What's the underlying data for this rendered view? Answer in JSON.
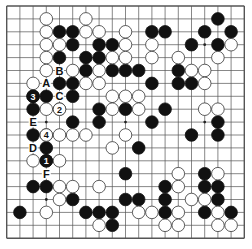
{
  "board": {
    "size": 19,
    "colors": {
      "background": "#ffffff",
      "line": "#555555",
      "black": "#111111",
      "white": "#ffffff",
      "white_stroke": "#333333"
    },
    "star_points": [
      [
        3,
        3
      ],
      [
        3,
        9
      ],
      [
        3,
        15
      ],
      [
        9,
        3
      ],
      [
        9,
        9
      ],
      [
        9,
        15
      ],
      [
        15,
        3
      ],
      [
        15,
        9
      ],
      [
        15,
        15
      ]
    ],
    "stones": {
      "black": [
        [
          1,
          16
        ],
        [
          2,
          4
        ],
        [
          2,
          5
        ],
        [
          2,
          11
        ],
        [
          2,
          12
        ],
        [
          2,
          15
        ],
        [
          2,
          17
        ],
        [
          3,
          5
        ],
        [
          3,
          7
        ],
        [
          3,
          8
        ],
        [
          3,
          14
        ],
        [
          3,
          16
        ],
        [
          4,
          4
        ],
        [
          4,
          6
        ],
        [
          4,
          7
        ],
        [
          5,
          6
        ],
        [
          5,
          8
        ],
        [
          5,
          9
        ],
        [
          5,
          10
        ],
        [
          5,
          13
        ],
        [
          6,
          4
        ],
        [
          6,
          5
        ],
        [
          6,
          11
        ],
        [
          6,
          13
        ],
        [
          6,
          14
        ],
        [
          7,
          2
        ],
        [
          7,
          3
        ],
        [
          7,
          5
        ],
        [
          8,
          2
        ],
        [
          8,
          7
        ],
        [
          8,
          9
        ],
        [
          8,
          12
        ],
        [
          9,
          5
        ],
        [
          9,
          7
        ],
        [
          9,
          11
        ],
        [
          9,
          16
        ],
        [
          10,
          2
        ],
        [
          10,
          14
        ],
        [
          10,
          16
        ],
        [
          11,
          3
        ],
        [
          11,
          10
        ],
        [
          12,
          3
        ],
        [
          13,
          9
        ],
        [
          13,
          15
        ],
        [
          14,
          2
        ],
        [
          14,
          3
        ],
        [
          14,
          12
        ],
        [
          14,
          15
        ],
        [
          14,
          16
        ],
        [
          15,
          5
        ],
        [
          15,
          9
        ],
        [
          15,
          10
        ],
        [
          15,
          12
        ],
        [
          15,
          16
        ],
        [
          16,
          1
        ],
        [
          16,
          6
        ],
        [
          16,
          7
        ],
        [
          16,
          8
        ],
        [
          16,
          12
        ],
        [
          16,
          15
        ],
        [
          16,
          17
        ],
        [
          17,
          8
        ]
      ],
      "white": [
        [
          1,
          3
        ],
        [
          1,
          6
        ],
        [
          2,
          3
        ],
        [
          2,
          6
        ],
        [
          2,
          7
        ],
        [
          2,
          9
        ],
        [
          3,
          3
        ],
        [
          3,
          4
        ],
        [
          3,
          9
        ],
        [
          3,
          11
        ],
        [
          3,
          17
        ],
        [
          4,
          3
        ],
        [
          4,
          8
        ],
        [
          4,
          9
        ],
        [
          4,
          11
        ],
        [
          4,
          13
        ],
        [
          4,
          16
        ],
        [
          5,
          3
        ],
        [
          5,
          5
        ],
        [
          5,
          7
        ],
        [
          5,
          14
        ],
        [
          5,
          15
        ],
        [
          6,
          2
        ],
        [
          6,
          6
        ],
        [
          6,
          7
        ],
        [
          6,
          15
        ],
        [
          7,
          8
        ],
        [
          7,
          9
        ],
        [
          7,
          10
        ],
        [
          8,
          3
        ],
        [
          8,
          4
        ],
        [
          8,
          8
        ],
        [
          8,
          10
        ],
        [
          8,
          15
        ],
        [
          8,
          16
        ],
        [
          10,
          3
        ],
        [
          10,
          4
        ],
        [
          10,
          5
        ],
        [
          10,
          6
        ],
        [
          10,
          9
        ],
        [
          11,
          8
        ],
        [
          12,
          2
        ],
        [
          12,
          4
        ],
        [
          13,
          13
        ],
        [
          13,
          16
        ],
        [
          14,
          4
        ],
        [
          14,
          5
        ],
        [
          14,
          7
        ],
        [
          14,
          13
        ],
        [
          15,
          4
        ],
        [
          15,
          14
        ],
        [
          15,
          15
        ],
        [
          16,
          3
        ],
        [
          16,
          10
        ],
        [
          16,
          11
        ],
        [
          16,
          13
        ],
        [
          16,
          16
        ],
        [
          17,
          7
        ],
        [
          17,
          12
        ],
        [
          17,
          13
        ],
        [
          17,
          16
        ],
        [
          17,
          17
        ]
      ]
    },
    "numbered_moves": [
      {
        "number": "1",
        "color": "black",
        "row": 12,
        "col": 3
      },
      {
        "number": "2",
        "color": "white",
        "row": 8,
        "col": 4
      },
      {
        "number": "3",
        "color": "black",
        "row": 7,
        "col": 2
      },
      {
        "number": "4",
        "color": "white",
        "row": 10,
        "col": 3
      }
    ],
    "letter_labels": [
      {
        "label": "A",
        "row": 6,
        "col": 3
      },
      {
        "label": "B",
        "row": 5,
        "col": 4
      },
      {
        "label": "C",
        "row": 7,
        "col": 4
      },
      {
        "label": "D",
        "row": 11,
        "col": 2
      },
      {
        "label": "E",
        "row": 9,
        "col": 2
      },
      {
        "label": "F",
        "row": 13,
        "col": 3
      }
    ]
  }
}
